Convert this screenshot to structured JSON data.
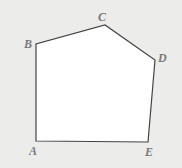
{
  "figure": {
    "type": "pentagon",
    "background": "#ececeb",
    "fill": "#ffffff",
    "stroke": "#444444",
    "label_color": "#7a7a7a",
    "vertices": [
      {
        "label": "A",
        "x": 36,
        "y": 141,
        "lx": 29,
        "ly": 155
      },
      {
        "label": "B",
        "x": 36,
        "y": 44,
        "lx": 24,
        "ly": 48
      },
      {
        "label": "C",
        "x": 105,
        "y": 25,
        "lx": 98,
        "ly": 21
      },
      {
        "label": "D",
        "x": 155,
        "y": 60,
        "lx": 158,
        "ly": 62
      },
      {
        "label": "E",
        "x": 148,
        "y": 142,
        "lx": 145,
        "ly": 156
      }
    ]
  }
}
